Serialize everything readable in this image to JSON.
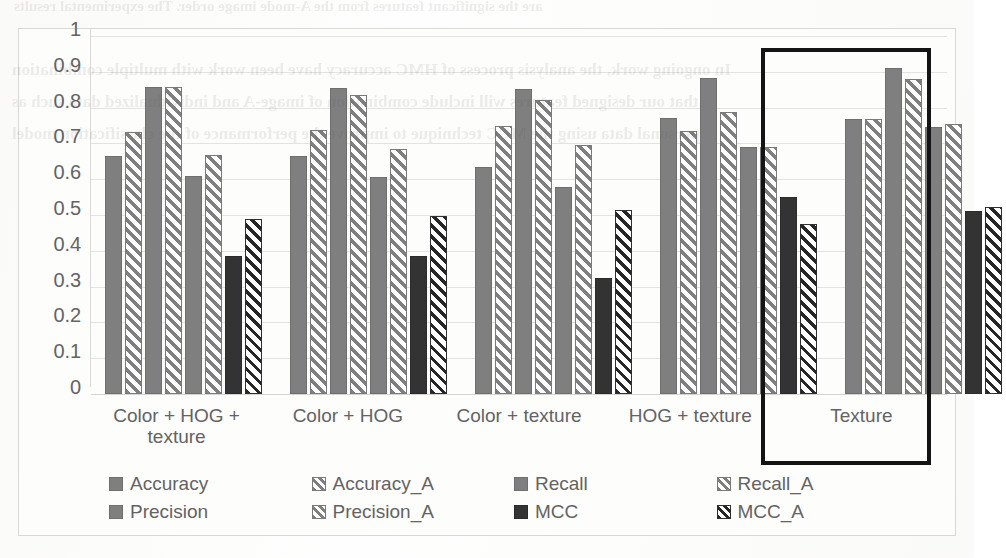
{
  "chart_data": {
    "type": "bar",
    "title": "",
    "subtitle": "",
    "xlabel": "",
    "ylabel": "",
    "ylim": [
      0,
      1
    ],
    "y_ticks": [
      "0",
      "0.1",
      "0.2",
      "0.3",
      "0.4",
      "0.5",
      "0.6",
      "0.7",
      "0.8",
      "0.9",
      "1"
    ],
    "grid": true,
    "legend_position": "bottom",
    "categories": [
      "Color + HOG + texture",
      "Color + HOG",
      "Color + texture",
      "HOG + texture",
      "Texture"
    ],
    "series": [
      {
        "name": "Accuracy",
        "style": "solid-grey",
        "values": [
          0.665,
          0.665,
          0.633,
          0.77,
          0.768
        ]
      },
      {
        "name": "Accuracy_A",
        "style": "hatch-grey",
        "values": [
          0.733,
          0.737,
          0.75,
          0.735,
          0.768
        ]
      },
      {
        "name": "Recall",
        "style": "solid-grey",
        "values": [
          0.857,
          0.855,
          0.852,
          0.882,
          0.911
        ]
      },
      {
        "name": "Recall_A",
        "style": "hatch-grey",
        "values": [
          0.858,
          0.835,
          0.82,
          0.787,
          0.88
        ]
      },
      {
        "name": "Precision",
        "style": "solid-grey",
        "values": [
          0.61,
          0.607,
          0.577,
          0.69,
          0.745
        ]
      },
      {
        "name": "Precision_A",
        "style": "hatch-grey",
        "values": [
          0.667,
          0.685,
          0.695,
          0.69,
          0.755
        ]
      },
      {
        "name": "MCC",
        "style": "solid-dark",
        "values": [
          0.386,
          0.386,
          0.325,
          0.55,
          0.511
        ]
      },
      {
        "name": "MCC_A",
        "style": "hatch-dark",
        "values": [
          0.489,
          0.497,
          0.515,
          0.475,
          0.521
        ]
      }
    ],
    "annotations": [
      {
        "type": "highlight-rectangle",
        "target_category": "Texture",
        "color": "#141414"
      }
    ],
    "colors": {
      "series_solid_grey": "#7f7f7f",
      "series_hatch_grey": "#7f7f7f",
      "series_solid_dark": "#333333",
      "series_hatch_dark": "#262626",
      "gridline": "#e3e3e1",
      "text": "#636363",
      "highlight": "#141414",
      "plot_background": "#fdfdfc"
    }
  },
  "scan_bleed": {
    "lines": [
      "are the significant features from the A-mode image order. The experimental results",
      "In ongoing work, the analysis process of HMC accuracy have been work with multiple combination",
      "that our designed features will include combination of image-A and individualized data such as",
      "personal data using the MCC technique to improve the performance of the classification model"
    ]
  }
}
